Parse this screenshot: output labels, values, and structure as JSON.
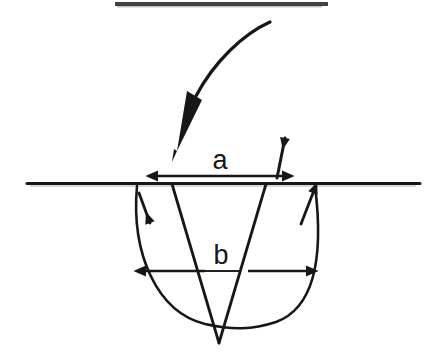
{
  "figure": {
    "title": "Schematic cross-section of an indentation crack",
    "background_color": "#ffffff",
    "ink_color": "#17171a",
    "surface_line_label": "surface-line",
    "elements": {
      "top_rule": "top-rule",
      "indenter": "indenter-arrow",
      "indenter_tip": "indenter-tip",
      "surface_line": "surface-line",
      "notch": "v-notch",
      "plastic_zone": "plastic-zone-arc",
      "flow_arrow_left": "flow-arrow-down-left",
      "flow_arrow_right": "flow-arrow-up-right",
      "pileup_arrow": "pile-up-arrow"
    },
    "labels": [
      {
        "id": "a",
        "text": "a",
        "meaning": "surface opening width",
        "x": 220,
        "y": 169
      },
      {
        "id": "b",
        "text": "b",
        "meaning": "plastic zone width",
        "x": 221,
        "y": 264
      }
    ],
    "dimensions": [
      {
        "id": "a",
        "name": "dimension-a",
        "orientation": "horizontal",
        "arrowheads": "both",
        "x_start": 158,
        "x_end": 282,
        "y": 176,
        "length_px": 124
      },
      {
        "id": "b",
        "name": "dimension-b",
        "orientation": "horizontal",
        "arrowheads": "both",
        "x_start": 146,
        "x_end": 306,
        "y": 271,
        "length_px": 160
      }
    ],
    "geometry": {
      "top_rule": {
        "x1": 115,
        "x2": 328,
        "y": 4,
        "thickness": 4
      },
      "surface_line": {
        "x1": 27,
        "x2": 420,
        "y": 183,
        "thickness": 3
      },
      "notch": {
        "left_x": 172,
        "right_x": 266,
        "top_y": 184,
        "apex_x": 219,
        "apex_y": 343
      },
      "plastic_zone_arc": {
        "left_x": 136,
        "right_x": 316,
        "top_y": 186,
        "bottom_y": 326
      }
    }
  }
}
